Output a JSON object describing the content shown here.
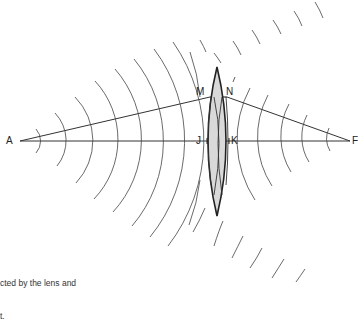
{
  "diagram": {
    "labels": {
      "A": "A",
      "F": "F",
      "M": "M",
      "N": "N",
      "J": "J",
      "K": "K",
      "N_prime_mark": "′"
    },
    "caption": {
      "line1": "cted by the lens and",
      "line2": "t."
    },
    "colors": {
      "stroke": "#333333",
      "lens_fill": "#d9d9d9",
      "background": "#ffffff",
      "text": "#222222"
    },
    "geometry": {
      "axis_y": 141,
      "A_x": 20,
      "F_x": 350,
      "M": [
        210,
        97
      ],
      "N": [
        227,
        97
      ],
      "J_x": 207,
      "K_x": 229,
      "lens_top": [
        217,
        67
      ],
      "lens_bottom": [
        217,
        216
      ],
      "left_wavefront_axis_crossings": [
        38,
        60,
        82,
        106,
        127,
        150,
        172,
        193
      ],
      "right_wavefront_axis_crossings": [
        242,
        262,
        283,
        304,
        327
      ]
    }
  }
}
